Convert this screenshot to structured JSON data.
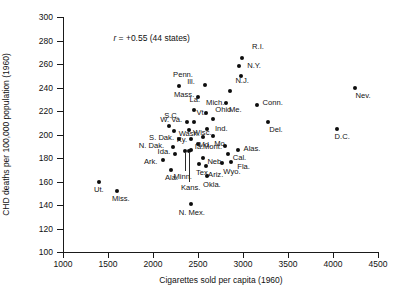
{
  "chart_data": {
    "type": "scatter",
    "title": "",
    "xlabel": "Cigarettes sold per capita (1960)",
    "ylabel": "CHD deaths per 100,000 population (1960)",
    "annotation": "r = +0.55 (44 states)",
    "annotation_r_symbol": "r",
    "annotation_rest": " = +0.55 (44 states)",
    "xlim": [
      1000,
      4500
    ],
    "ylim": [
      100,
      300
    ],
    "xticks": [
      1000,
      1500,
      2000,
      2500,
      3000,
      3500,
      4000,
      4500
    ],
    "yticks": [
      100,
      120,
      140,
      160,
      180,
      200,
      220,
      240,
      260,
      280,
      300
    ],
    "grid": false,
    "legend": "none",
    "n_points": 45,
    "points": [
      {
        "label": "R.I.",
        "x": 2990,
        "y": 265,
        "lx": 10,
        "ly": -11
      },
      {
        "label": "",
        "x": 2960,
        "y": 258,
        "lx": 0,
        "ly": 0
      },
      {
        "label": "N.Y.",
        "x": 2980,
        "y": 250,
        "lx": 6,
        "ly": -10
      },
      {
        "label": "Penn.",
        "x": 2290,
        "y": 241,
        "lx": -6,
        "ly": -11
      },
      {
        "label": "Ill.",
        "x": 2580,
        "y": 242,
        "lx": -18,
        "ly": -3
      },
      {
        "label": "N.J.",
        "x": 2860,
        "y": 237,
        "lx": 5,
        "ly": -10
      },
      {
        "label": "Mass.",
        "x": 2500,
        "y": 232,
        "lx": -24,
        "ly": -2
      },
      {
        "label": "Conn.",
        "x": 3150,
        "y": 225,
        "lx": 6,
        "ly": -2
      },
      {
        "label": "Me.",
        "x": 2810,
        "y": 227,
        "lx": 3,
        "ly": 7
      },
      {
        "label": "La.",
        "x": 2450,
        "y": 221,
        "lx": -4,
        "ly": -10
      },
      {
        "label": "Mich.",
        "x": 2590,
        "y": 218,
        "lx": 0,
        "ly": -10
      },
      {
        "label": "Ohio",
        "x": 2670,
        "y": 213,
        "lx": 2,
        "ly": -9
      },
      {
        "label": "Del.",
        "x": 3280,
        "y": 211,
        "lx": 1,
        "ly": 8
      },
      {
        "label": "W. Va.",
        "x": 2380,
        "y": 211,
        "lx": -27,
        "ly": -2
      },
      {
        "label": "Vt.",
        "x": 2450,
        "y": 211,
        "lx": 3,
        "ly": -9
      },
      {
        "label": "S.C.",
        "x": 2180,
        "y": 207,
        "lx": -5,
        "ly": -10
      },
      {
        "label": "Ind.",
        "x": 2600,
        "y": 205,
        "lx": 8,
        "ly": 0
      },
      {
        "label": "Wash.",
        "x": 2230,
        "y": 203,
        "lx": 5,
        "ly": 3
      },
      {
        "label": "Wisc.",
        "x": 2400,
        "y": 204,
        "lx": 4,
        "ly": 3
      },
      {
        "label": "Md.",
        "x": 2560,
        "y": 198,
        "lx": -5,
        "ly": 8
      },
      {
        "label": "Mo.",
        "x": 2670,
        "y": 199,
        "lx": 1,
        "ly": 8
      },
      {
        "label": "Ky.",
        "x": 2420,
        "y": 196,
        "lx": -14,
        "ly": 1
      },
      {
        "label": "S. Dak.",
        "x": 2290,
        "y": 196,
        "lx": -30,
        "ly": -1
      },
      {
        "label": "Mont.",
        "x": 2500,
        "y": 192,
        "lx": 5,
        "ly": 3
      },
      {
        "label": "N. Dak.",
        "x": 2220,
        "y": 189,
        "lx": -34,
        "ly": -1
      },
      {
        "label": "Alas.",
        "x": 2940,
        "y": 187,
        "lx": 6,
        "ly": -1
      },
      {
        "label": "Ia.",
        "x": 2420,
        "y": 187,
        "lx": 4,
        "ly": -3
      },
      {
        "label": "Cal.",
        "x": 2830,
        "y": 183,
        "lx": 5,
        "ly": 4
      },
      {
        "label": "",
        "x": 2800,
        "y": 190,
        "lx": 0,
        "ly": 0
      },
      {
        "label": "Ida.",
        "x": 2240,
        "y": 183,
        "lx": -17,
        "ly": -2
      },
      {
        "label": "Neb.",
        "x": 2560,
        "y": 180,
        "lx": 4,
        "ly": 4
      },
      {
        "label": "Ark.",
        "x": 2110,
        "y": 178,
        "lx": -19,
        "ly": 2
      },
      {
        "label": "Wyo.",
        "x": 2770,
        "y": 176,
        "lx": 1,
        "ly": 9
      },
      {
        "label": "Fla.",
        "x": 2870,
        "y": 177,
        "lx": 6,
        "ly": 5
      },
      {
        "label": "Tex.",
        "x": 2510,
        "y": 175,
        "lx": -3,
        "ly": 9
      },
      {
        "label": "Ariz.",
        "x": 2590,
        "y": 173,
        "lx": 2,
        "ly": 9
      },
      {
        "label": "Minn.",
        "x": 2360,
        "y": 186,
        "lx": -12,
        "ly": 26,
        "leader": true
      },
      {
        "label": "Ala.",
        "x": 2200,
        "y": 170,
        "lx": -6,
        "ly": 8
      },
      {
        "label": "Okla.",
        "x": 2600,
        "y": 165,
        "lx": -4,
        "ly": 9
      },
      {
        "label": "Kans.",
        "x": 2400,
        "y": 186,
        "lx": -8,
        "ly": 37,
        "leader": true
      },
      {
        "label": "Ut.",
        "x": 1400,
        "y": 160,
        "lx": -5,
        "ly": 8
      },
      {
        "label": "Miss.",
        "x": 1600,
        "y": 152,
        "lx": -5,
        "ly": 8
      },
      {
        "label": "N. Mex.",
        "x": 2420,
        "y": 141,
        "lx": -12,
        "ly": 9
      },
      {
        "label": "Nev.",
        "x": 4240,
        "y": 240,
        "lx": 1,
        "ly": 8
      },
      {
        "label": "D.C.",
        "x": 4040,
        "y": 205,
        "lx": -2,
        "ly": 8
      }
    ]
  }
}
